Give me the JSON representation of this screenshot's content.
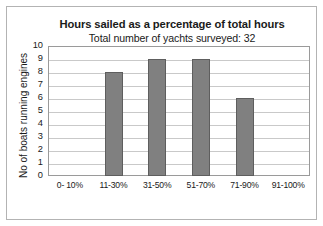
{
  "chart_data": {
    "type": "bar",
    "title": "Hours sailed as a percentage of total hours",
    "subtitle": "Total number of yachts surveyed: 32",
    "xlabel": "",
    "ylabel": "No of boats running engines",
    "categories": [
      "0- 10%",
      "11-30%",
      "31-50%",
      "51-70%",
      "71-90%",
      "91-100%"
    ],
    "values": [
      0,
      8,
      9,
      9,
      6,
      0
    ],
    "ylim": [
      0,
      10
    ],
    "ytick_labels": [
      "0",
      "1",
      "2",
      "3",
      "4",
      "5",
      "6",
      "7",
      "8",
      "9",
      "10"
    ],
    "ytick_values": [
      0,
      1,
      2,
      3,
      4,
      5,
      6,
      7,
      8,
      9,
      10
    ],
    "grid": "horizontal",
    "legend": "none",
    "bar_color": "#808080",
    "bar_edge_color": "#5e5e5e",
    "gridline_color": "#c9c9c9",
    "axis_color": "#9a9a9a",
    "frame_color": "#b3b3b3",
    "text_color": "#1a1a1a"
  }
}
